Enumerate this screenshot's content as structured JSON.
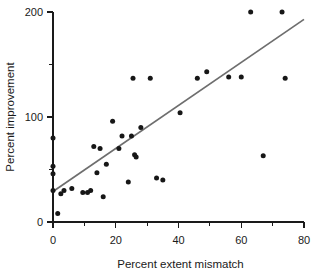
{
  "chart_data": {
    "type": "scatter",
    "title": "",
    "xlabel": "Percent extent mismatch",
    "ylabel": "Percent improvement",
    "xlim": [
      0,
      80
    ],
    "ylim": [
      0,
      200
    ],
    "grid": false,
    "legend": "none",
    "x_ticks": [
      0,
      20,
      40,
      60,
      80
    ],
    "x_tick_labels": [
      "0",
      "20",
      "40",
      "60",
      "80"
    ],
    "x_minor_ticks": [
      10,
      30,
      50,
      70
    ],
    "y_ticks": [
      0,
      100,
      200
    ],
    "y_tick_labels": [
      "0",
      "100",
      "200"
    ],
    "y_minor_ticks": [
      50,
      150
    ],
    "point_color": "#171717",
    "line_color": "#6e6e6e",
    "axis_color": "#1a1a1a",
    "points": [
      {
        "x": 0,
        "y": 80
      },
      {
        "x": 0,
        "y": 53
      },
      {
        "x": 0,
        "y": 46
      },
      {
        "x": 0,
        "y": 30
      },
      {
        "x": 1.5,
        "y": 8
      },
      {
        "x": 2.5,
        "y": 27
      },
      {
        "x": 3.5,
        "y": 30
      },
      {
        "x": 6,
        "y": 32
      },
      {
        "x": 9.5,
        "y": 28
      },
      {
        "x": 11,
        "y": 28
      },
      {
        "x": 12,
        "y": 30
      },
      {
        "x": 13,
        "y": 72
      },
      {
        "x": 14,
        "y": 47
      },
      {
        "x": 15,
        "y": 70
      },
      {
        "x": 16,
        "y": 24
      },
      {
        "x": 17,
        "y": 55
      },
      {
        "x": 19,
        "y": 96
      },
      {
        "x": 21,
        "y": 70
      },
      {
        "x": 22,
        "y": 82
      },
      {
        "x": 24,
        "y": 38
      },
      {
        "x": 25,
        "y": 82
      },
      {
        "x": 25.5,
        "y": 137
      },
      {
        "x": 26,
        "y": 64
      },
      {
        "x": 26.5,
        "y": 62
      },
      {
        "x": 28,
        "y": 90
      },
      {
        "x": 31,
        "y": 137
      },
      {
        "x": 33,
        "y": 42
      },
      {
        "x": 35,
        "y": 40
      },
      {
        "x": 40.5,
        "y": 104
      },
      {
        "x": 46,
        "y": 137
      },
      {
        "x": 49,
        "y": 143
      },
      {
        "x": 56,
        "y": 138
      },
      {
        "x": 60,
        "y": 138
      },
      {
        "x": 63,
        "y": 200
      },
      {
        "x": 67,
        "y": 63
      },
      {
        "x": 73,
        "y": 200
      },
      {
        "x": 74,
        "y": 137
      }
    ],
    "fit_line": {
      "x_start": 0,
      "y_start": 29,
      "x_end": 80,
      "y_end": 193
    }
  }
}
